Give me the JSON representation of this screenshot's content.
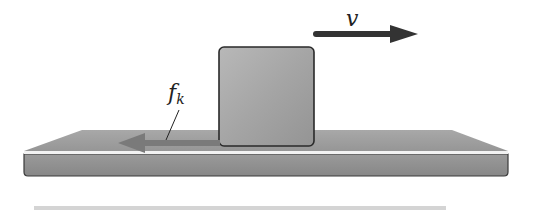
{
  "diagram": {
    "velocity": {
      "label": "v",
      "direction": "right",
      "color": "#333333"
    },
    "friction": {
      "label_main": "f",
      "label_sub": "k",
      "direction": "left",
      "color": "#7a7a7a"
    },
    "block": {
      "color": "#a9a9a9",
      "edge_color": "#2a2a2a"
    },
    "surface": {
      "top_color": "#9e9e9e",
      "front_color": "#8f8f8f",
      "highlight_color": "#f2f2f2",
      "edge_color": "#3a3a3a"
    },
    "strip": {
      "color": "#d4d4d4"
    }
  }
}
